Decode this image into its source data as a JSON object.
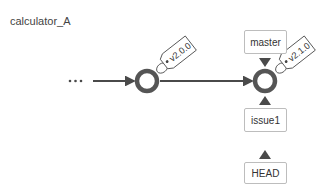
{
  "repository": {
    "name": "calculator_A"
  },
  "colors": {
    "line": "#4a4a4a",
    "box_border": "#bdbdbd",
    "text": "#333333"
  },
  "history": {
    "ellipsis": "···"
  },
  "commits": [
    {
      "id": "commit-1",
      "tag": "v2.0.0"
    },
    {
      "id": "commit-2",
      "tag": "v2.1.0"
    }
  ],
  "refs": {
    "master": "master",
    "issue1": "issue1",
    "head": "HEAD"
  }
}
